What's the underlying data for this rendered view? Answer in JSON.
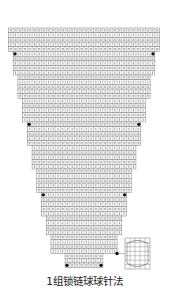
{
  "title": "1组锁链球球针法",
  "diagram": {
    "type": "crochet-chart",
    "shape": "stepped inverted triangle",
    "cell_w": 4.72,
    "cell_h": 4.7,
    "top_y": 28,
    "center_x": 84,
    "rows_total": 51,
    "row_symbols": [
      "chain",
      "stitch"
    ],
    "steps": [
      {
        "rows": 5,
        "cells": 32
      },
      {
        "rows": 5,
        "cells": 30
      },
      {
        "rows": 5,
        "cells": 28
      },
      {
        "rows": 5,
        "cells": 26
      },
      {
        "rows": 5,
        "cells": 24
      },
      {
        "rows": 5,
        "cells": 22
      },
      {
        "rows": 5,
        "cells": 20
      },
      {
        "rows": 5,
        "cells": 18
      },
      {
        "rows": 4,
        "cells": 16
      },
      {
        "rows": 4,
        "cells": 14
      },
      {
        "rows": 3,
        "cells": 8
      }
    ],
    "marker_rows": [
      5,
      20,
      35,
      50
    ],
    "colors": {
      "line": "#7a7a7a",
      "fill": "#ffffff",
      "marker": "#111111",
      "symbol": "#555555"
    }
  },
  "legend": {
    "marker": "black-dot",
    "symbol": "bobble-stitch",
    "box": {
      "x": 125,
      "y": 238,
      "w": 25,
      "h": 31,
      "cols": 5,
      "rows": 7
    }
  }
}
